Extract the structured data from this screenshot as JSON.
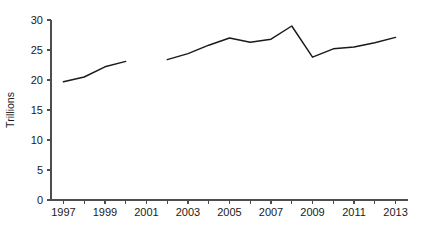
{
  "chart_data": {
    "type": "line",
    "title": "",
    "xlabel": "",
    "ylabel": "Trillions",
    "xlim": [
      1996.4,
      2013.6
    ],
    "ylim": [
      0,
      30
    ],
    "grid": false,
    "legend": false,
    "y_ticks": [
      0,
      5,
      10,
      15,
      20,
      25,
      30
    ],
    "y_tick_labels": [
      "0",
      "5",
      "10",
      "15",
      "20",
      "25",
      "30"
    ],
    "x_ticks": [
      1997,
      1999,
      2001,
      2003,
      2005,
      2007,
      2009,
      2011,
      2013
    ],
    "x_tick_labels": [
      "1997",
      "1999",
      "2001",
      "2003",
      "2005",
      "2007",
      "2009",
      "2011",
      "2013"
    ],
    "x_minor_ticks": [
      1998,
      2000,
      2002,
      2004,
      2006,
      2008,
      2010,
      2012
    ],
    "series": [
      {
        "name": "segment-1",
        "color": "#1a1a1a",
        "x": [
          1997,
          1998,
          1999,
          2000
        ],
        "values": [
          19.7,
          20.5,
          22.2,
          23.1
        ]
      },
      {
        "name": "segment-2",
        "color": "#1a1a1a",
        "x": [
          2002,
          2003,
          2004,
          2005,
          2006,
          2007,
          2008,
          2009,
          2010,
          2011,
          2012,
          2013
        ],
        "values": [
          23.4,
          24.4,
          25.8,
          27.0,
          26.3,
          26.8,
          29.0,
          23.8,
          25.2,
          25.5,
          26.2,
          27.1
        ]
      }
    ]
  },
  "axis": {
    "y_title": "Trillions"
  },
  "colors": {
    "line": "#1a1a1a",
    "axis": "#4d4d4d",
    "background": "#ffffff"
  }
}
